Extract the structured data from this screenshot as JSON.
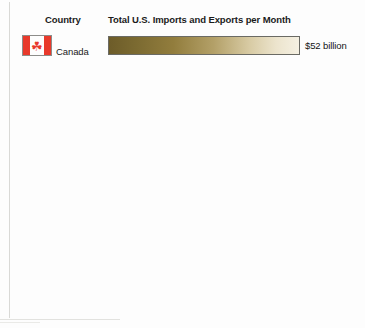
{
  "chart_data": {
    "type": "bar",
    "title": "",
    "xlabel": "",
    "ylabel": "",
    "orientation": "horizontal",
    "grid": false,
    "legend": false,
    "unit": "billion US dollars per month",
    "categories": [
      "Canada",
      "China",
      "Mexico",
      "Japan",
      "Germany",
      "United Kingdom",
      "South Korea",
      "France",
      "Brazil",
      "Saudi Arabia"
    ],
    "values": [
      52,
      50,
      43,
      17,
      14,
      9,
      8,
      6.4,
      6.1,
      6
    ],
    "value_labels": [
      "$52 billion",
      "$50",
      "$43",
      "$17",
      "$14",
      "$9",
      "$8",
      "$6.4",
      "$6.1",
      "$6"
    ],
    "xlim": [
      0,
      52
    ]
  },
  "headers": {
    "country": "Country",
    "metric": "Total U.S. Imports and Exports per Month"
  },
  "rows": [
    {
      "country": "Canada",
      "flag": "flag-canada",
      "value_label": "$52 billion",
      "value": 52
    },
    {
      "country": "China",
      "flag": "flag-china",
      "value_label": "$50",
      "value": 50
    },
    {
      "country": "Mexico",
      "flag": "flag-mexico",
      "value_label": "$43",
      "value": 43
    },
    {
      "country": "Japan",
      "flag": "flag-japan",
      "value_label": "$17",
      "value": 17
    },
    {
      "country": "Germany",
      "flag": "flag-germany",
      "value_label": "$14",
      "value": 14
    },
    {
      "country": "United\nKingdom",
      "flag": "flag-united-kingdom",
      "value_label": "$9",
      "value": 9
    },
    {
      "country": "South Korea",
      "flag": "flag-south-korea",
      "value_label": "$8",
      "value": 8
    },
    {
      "country": "France",
      "flag": "flag-france",
      "value_label": "$6.4",
      "value": 6.4
    },
    {
      "country": "Brazil",
      "flag": "flag-brazil",
      "value_label": "$6.1",
      "value": 6.1
    },
    {
      "country": "Saudi Arabia",
      "flag": "flag-saudi-arabia",
      "value_label": "$6",
      "value": 6
    }
  ],
  "flag_glyphs": {
    "canada_leaf": "☘",
    "saudi_text": "لا إله إلا الله"
  },
  "colors": {
    "background": "#fdfdfd",
    "bar_dark": "#6d5c29",
    "bar_light": "#f5f0e2",
    "bar_border": "#6a6a64",
    "text": "#1a1a1a",
    "rule": "#d9d9d6"
  }
}
